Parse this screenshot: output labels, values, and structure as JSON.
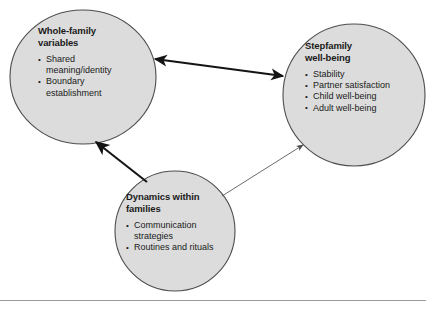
{
  "figure": {
    "colors": {
      "node_fill": "#dcdcdc",
      "node_stroke": "#4d4d4d",
      "arrow_strong": "#141414",
      "arrow_weak": "#5a5a5a",
      "text": "#1a1a1a",
      "rule": "#9a9a9a",
      "background": "#ffffff"
    },
    "nodes": [
      {
        "id": "whole-family",
        "shape": "ellipse",
        "title": "Whole-family variables",
        "title_lines": [
          "Whole-family",
          "variables"
        ],
        "items": [
          "Shared meaning/identity",
          "Boundary establishment"
        ]
      },
      {
        "id": "stepfamily",
        "shape": "circle",
        "title": "Stepfamily well-being",
        "title_lines": [
          "Stepfamily",
          "well-being"
        ],
        "items": [
          "Stability",
          "Partner satisfaction",
          "Child well-being",
          "Adult well-being"
        ]
      },
      {
        "id": "dynamics",
        "shape": "circle",
        "title": "Dynamics within families",
        "title_lines": [
          "Dynamics within",
          "families"
        ],
        "items": [
          "Communication strategies",
          "Routines and rituals"
        ]
      }
    ],
    "connectors": [
      {
        "id": "whole-family-stepfamily",
        "from": "whole-family",
        "to": "stepfamily",
        "direction": "bidirectional",
        "weight": "thick"
      },
      {
        "id": "dynamics-whole-family",
        "from": "dynamics",
        "to": "whole-family",
        "direction": "unidirectional",
        "weight": "thick"
      },
      {
        "id": "dynamics-stepfamily",
        "from": "dynamics",
        "to": "stepfamily",
        "direction": "unidirectional",
        "weight": "thin"
      }
    ]
  }
}
